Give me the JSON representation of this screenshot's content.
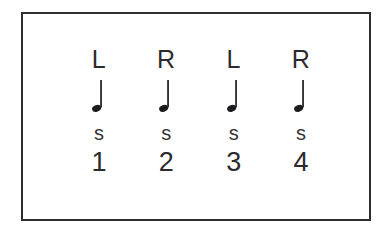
{
  "figure": {
    "frame": {
      "border_color": "#2e2e30",
      "background_color": "#ffffff"
    },
    "page_background": "#ffffff",
    "note_color": "#1c1c1e",
    "text_color": "#2b2b2d"
  },
  "columns": [
    {
      "hand": "L",
      "note_icon": "quarter-note",
      "stroke": "s",
      "count": "1"
    },
    {
      "hand": "R",
      "note_icon": "quarter-note",
      "stroke": "s",
      "count": "2"
    },
    {
      "hand": "L",
      "note_icon": "quarter-note",
      "stroke": "s",
      "count": "3"
    },
    {
      "hand": "R",
      "note_icon": "quarter-note",
      "stroke": "s",
      "count": "4"
    }
  ]
}
